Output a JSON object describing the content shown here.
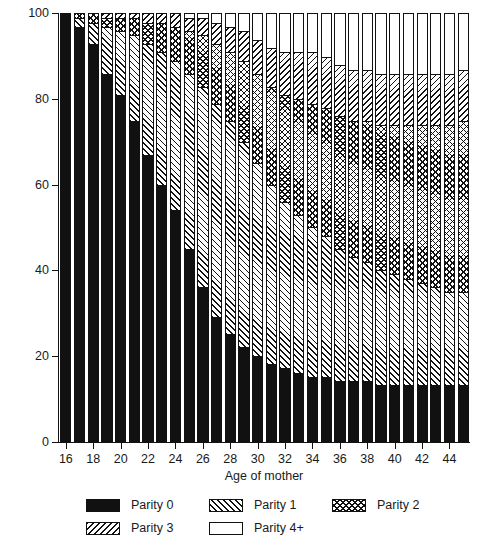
{
  "chart_data": {
    "type": "bar",
    "subtype": "stacked-bar-100",
    "title": "",
    "xlabel": "Age of mother",
    "ylabel": "Probability (%)",
    "ylim": [
      0,
      100
    ],
    "yticks": [
      0,
      20,
      40,
      60,
      80,
      100
    ],
    "xticks": [
      16,
      18,
      20,
      22,
      24,
      26,
      28,
      30,
      32,
      34,
      36,
      38,
      40,
      42,
      44
    ],
    "grid": false,
    "legend_position": "bottom",
    "categories": [
      16,
      17,
      18,
      19,
      20,
      21,
      22,
      23,
      24,
      25,
      26,
      27,
      28,
      29,
      30,
      31,
      32,
      33,
      34,
      35,
      36,
      37,
      38,
      39,
      40,
      41,
      42,
      43,
      44,
      45
    ],
    "series": [
      {
        "name": "Parity 0",
        "pattern": "solid-black",
        "values": [
          100,
          97,
          93,
          86,
          81,
          75,
          67,
          60,
          54,
          45,
          36,
          29,
          25,
          22,
          20,
          18,
          17,
          16,
          15,
          15,
          14,
          14,
          14,
          13,
          13,
          13,
          13,
          13,
          13,
          13
        ]
      },
      {
        "name": "Parity 1",
        "pattern": "forward-diagonal-hatch",
        "values": [
          0,
          2,
          5,
          11,
          15,
          20,
          26,
          31,
          35,
          41,
          47,
          50,
          50,
          48,
          45,
          42,
          39,
          37,
          35,
          33,
          31,
          29,
          28,
          27,
          26,
          25,
          24,
          23,
          22,
          22
        ]
      },
      {
        "name": "Parity 2",
        "pattern": "cross-hatch",
        "values": [
          0,
          1,
          2,
          2,
          3,
          4,
          5,
          7,
          8,
          10,
          12,
          14,
          16,
          19,
          21,
          23,
          25,
          27,
          29,
          30,
          31,
          32,
          33,
          34,
          35,
          36,
          37,
          38,
          39,
          40
        ]
      },
      {
        "name": "Parity 3",
        "pattern": "backward-diagonal-hatch",
        "values": [
          0,
          0,
          0,
          1,
          1,
          1,
          2,
          2,
          3,
          3,
          4,
          5,
          6,
          7,
          8,
          9,
          10,
          11,
          12,
          12,
          12,
          12,
          12,
          12,
          12,
          12,
          12,
          12,
          12,
          12
        ]
      },
      {
        "name": "Parity 4+",
        "pattern": "empty-white",
        "values": [
          0,
          0,
          0,
          0,
          0,
          0,
          0,
          0,
          0,
          1,
          1,
          2,
          3,
          4,
          6,
          8,
          9,
          9,
          9,
          10,
          12,
          13,
          13,
          14,
          14,
          14,
          14,
          14,
          14,
          13
        ]
      }
    ]
  },
  "legend": {
    "items": [
      {
        "label": "Parity 0",
        "pattern": "p0"
      },
      {
        "label": "Parity 1",
        "pattern": "p1"
      },
      {
        "label": "Parity 2",
        "pattern": "p2"
      },
      {
        "label": "Parity 3",
        "pattern": "p3"
      },
      {
        "label": "Parity 4+",
        "pattern": "p4"
      }
    ]
  },
  "colors": {
    "ink": "#111111",
    "paper": "#ffffff"
  }
}
